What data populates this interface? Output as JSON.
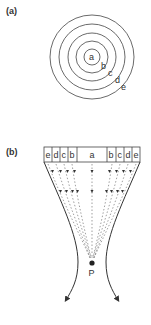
{
  "panel_a": {
    "label": "(a)",
    "rings": [
      "a",
      "b",
      "c",
      "d",
      "e"
    ]
  },
  "panel_b": {
    "label": "(b)",
    "cells": [
      "e",
      "d",
      "c",
      "b",
      "a",
      "b",
      "c",
      "d",
      "e"
    ],
    "focus_label": "P"
  },
  "colors": {
    "stroke": "#333333",
    "dash": "#777777",
    "background": "#ffffff"
  }
}
